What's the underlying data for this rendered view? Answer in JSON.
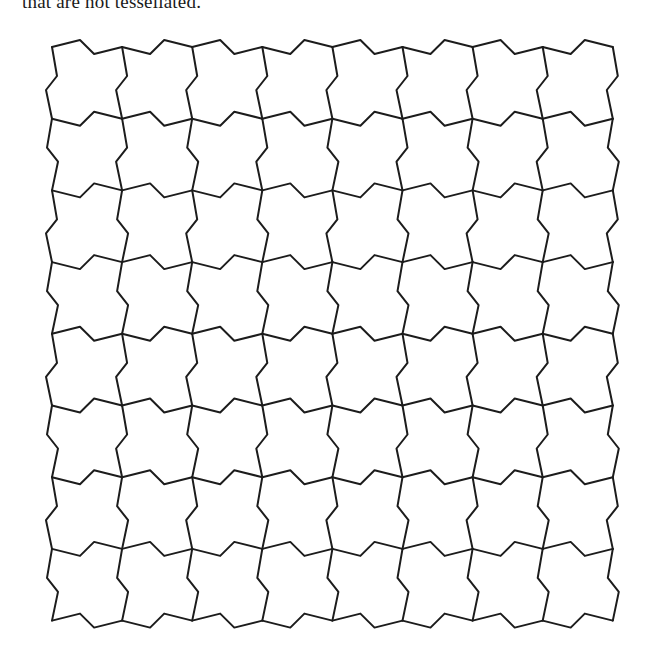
{
  "page": {
    "clipped_text_line": "that are not tessellated."
  },
  "figure": {
    "tile_columns": 8,
    "tile_rows": 8,
    "line_color": "#1c1c1c"
  }
}
